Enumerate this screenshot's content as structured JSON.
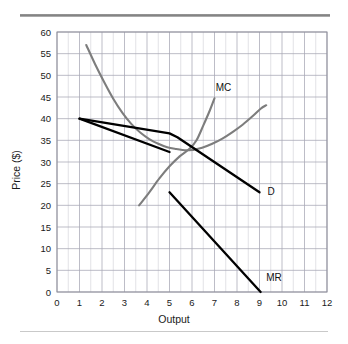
{
  "figure": {
    "background_color": "#ffffff",
    "top_rule_color": "#8a8a8a",
    "bottom_rule_color": "#c9c9c9"
  },
  "chart_data": {
    "type": "line",
    "title": "",
    "xlabel": "Output",
    "ylabel": "Price ($)",
    "xlim": [
      0,
      12
    ],
    "ylim": [
      0,
      60
    ],
    "xticks": [
      "0",
      "1",
      "2",
      "3",
      "4",
      "5",
      "6",
      "7",
      "8",
      "9",
      "10",
      "11",
      "12"
    ],
    "yticks": [
      "0",
      "5",
      "10",
      "15",
      "20",
      "25",
      "30",
      "35",
      "40",
      "45",
      "50",
      "55",
      "60"
    ],
    "grid": true,
    "grid_color": "#a8a8b4",
    "grid_minor_x_step": 0.5,
    "grid_minor_y_step": 5,
    "legend_position": "inline-labels",
    "series": [
      {
        "name": "MC",
        "label": "MC",
        "color": "#7d7d7d",
        "style": "curve",
        "label_x": 7.05,
        "label_y": 46.5,
        "points": [
          [
            1.3,
            57.0
          ],
          [
            1.7,
            52.5
          ],
          [
            2.1,
            48.4
          ],
          [
            2.5,
            44.6
          ],
          [
            2.9,
            41.4
          ],
          [
            3.3,
            38.8
          ],
          [
            3.7,
            36.8
          ],
          [
            4.1,
            35.3
          ],
          [
            4.5,
            34.2
          ],
          [
            4.9,
            33.4
          ],
          [
            5.3,
            33.0
          ],
          [
            5.75,
            32.7
          ],
          [
            6.05,
            32.8
          ]
        ]
      },
      {
        "name": "MC-rising",
        "label": "",
        "color": "#7d7d7d",
        "style": "curve",
        "points": [
          [
            6.05,
            32.8
          ],
          [
            6.45,
            33.3
          ],
          [
            6.9,
            34.2
          ],
          [
            7.35,
            35.4
          ],
          [
            7.8,
            36.9
          ],
          [
            8.25,
            38.6
          ],
          [
            8.7,
            40.6
          ],
          [
            9.05,
            42.3
          ],
          [
            9.3,
            43.1
          ]
        ]
      },
      {
        "name": "MC-steep",
        "label": "",
        "color": "#7d7d7d",
        "style": "curve",
        "points": [
          [
            3.65,
            20.0
          ],
          [
            4.1,
            23.0
          ],
          [
            4.55,
            26.2
          ],
          [
            5.0,
            29.0
          ],
          [
            5.45,
            31.3
          ],
          [
            5.9,
            33.1
          ],
          [
            6.2,
            35.0
          ],
          [
            6.5,
            38.4
          ],
          [
            6.8,
            42.0
          ],
          [
            7.0,
            44.7
          ]
        ]
      },
      {
        "name": "D",
        "label": "D",
        "color": "#000000",
        "style": "kinked-line",
        "label_x": 9.35,
        "label_y": 22.4,
        "points": [
          [
            1.0,
            40.0
          ],
          [
            5.0,
            36.6
          ],
          [
            5.35,
            35.7
          ],
          [
            9.0,
            23.0
          ]
        ]
      },
      {
        "name": "D-upper-segment",
        "label": "",
        "color": "#000000",
        "style": "line",
        "points": [
          [
            1.0,
            40.0
          ],
          [
            5.0,
            32.3
          ]
        ]
      },
      {
        "name": "MR",
        "label": "MR",
        "color": "#000000",
        "style": "line",
        "label_x": 9.3,
        "label_y": 2.6,
        "points": [
          [
            5.0,
            23.0
          ],
          [
            9.05,
            0.0
          ]
        ]
      }
    ]
  }
}
